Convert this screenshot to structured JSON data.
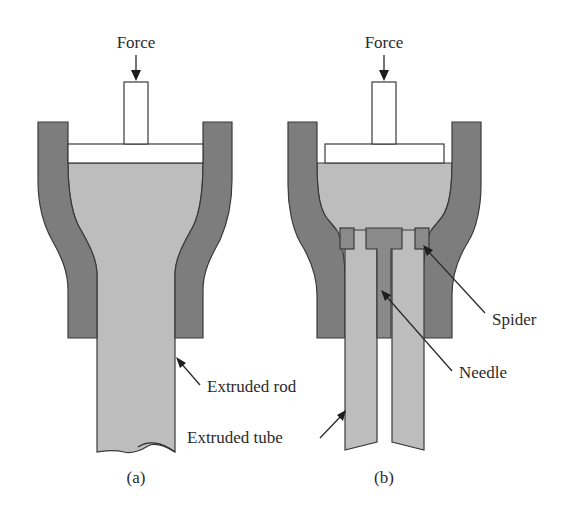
{
  "figure": {
    "panel_a": {
      "caption": "(a)",
      "force_label": "Force",
      "rod_label": "Extruded rod"
    },
    "panel_b": {
      "caption": "(b)",
      "force_label": "Force",
      "tube_label": "Extruded tube",
      "spider_label": "Spider",
      "needle_label": "Needle"
    },
    "colors": {
      "die": "#7d7d7d",
      "melt": "#bdbdbd",
      "plunger": "#ffffff",
      "outline": "#3a3a3a"
    }
  }
}
